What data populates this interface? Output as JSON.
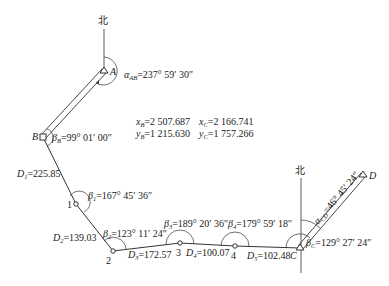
{
  "diagram": {
    "type": "closed-traverse-survey",
    "north_label": "北",
    "points": {
      "A": {
        "label": "A",
        "x": 104,
        "y": 71,
        "kind": "known"
      },
      "B": {
        "label": "B",
        "x": 43,
        "y": 137,
        "kind": "known"
      },
      "P1": {
        "label": "1",
        "x": 76,
        "y": 204,
        "kind": "traverse"
      },
      "P2": {
        "label": "2",
        "x": 113,
        "y": 251,
        "kind": "traverse"
      },
      "P3": {
        "label": "3",
        "x": 180,
        "y": 243,
        "kind": "traverse"
      },
      "P4": {
        "label": "4",
        "x": 235,
        "y": 246,
        "kind": "traverse"
      },
      "C": {
        "label": "C",
        "x": 300,
        "y": 248,
        "kind": "known"
      },
      "D": {
        "label": "D",
        "x": 363,
        "y": 175,
        "kind": "known"
      }
    },
    "azimuths": {
      "AB": {
        "symbol": "α",
        "sub": "AB",
        "value": "=237° 59′ 30″"
      },
      "CD": {
        "symbol": "α",
        "sub": "CD",
        "value": "=46° 45′ 24″"
      }
    },
    "angles": {
      "B": {
        "symbol": "β",
        "sub": "B",
        "value": "=99° 01′ 00″"
      },
      "1": {
        "symbol": "β",
        "sub": "1",
        "value": "=167° 45′ 36″"
      },
      "2": {
        "symbol": "β",
        "sub": "2",
        "value": "=123° 11′ 24″"
      },
      "3": {
        "symbol": "β",
        "sub": "3",
        "value": "=189° 20′ 36″"
      },
      "4": {
        "symbol": "β",
        "sub": "4",
        "value": "=179° 59′ 18″"
      },
      "C": {
        "symbol": "β",
        "sub": "C",
        "value": "=129° 27′ 24″"
      }
    },
    "distances": {
      "D1": {
        "symbol": "D",
        "sub": "1",
        "value": "=225.85"
      },
      "D2": {
        "symbol": "D",
        "sub": "2",
        "value": "=139.03"
      },
      "D3": {
        "symbol": "D",
        "sub": "3",
        "value": "=172.57"
      },
      "D4": {
        "symbol": "D",
        "sub": "4",
        "value": "=100.07"
      },
      "D5": {
        "symbol": "D",
        "sub": "5",
        "value": "=102.48"
      }
    },
    "coordinates": {
      "xB": {
        "symbol": "x",
        "sub": "B",
        "value": "=2 507.687"
      },
      "yB": {
        "symbol": "y",
        "sub": "B",
        "value": "=1 215.630"
      },
      "xC": {
        "symbol": "x",
        "sub": "C",
        "value": "=2 166.741"
      },
      "yC": {
        "symbol": "y",
        "sub": "C",
        "value": "=1 757.266"
      }
    }
  }
}
